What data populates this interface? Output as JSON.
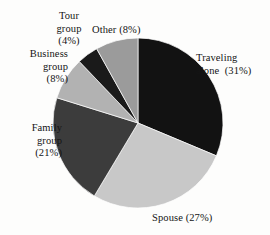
{
  "chart_data": {
    "type": "pie",
    "title": "",
    "subtitle": "",
    "xlabel": "",
    "ylabel": "",
    "legend_position": "none",
    "grid": false,
    "units": "percent",
    "start_angle_deg": 0,
    "direction": "clockwise",
    "categories": [
      "Traveling alone",
      "Spouse",
      "Family group",
      "Business group",
      "Tour group",
      "Other"
    ],
    "values": [
      31,
      27,
      21,
      8,
      4,
      8
    ],
    "slices": [
      {
        "name": "Traveling alone",
        "value": 31,
        "label": "Traveling\nalone  (31%)",
        "label_line1": "Traveling",
        "label_line2": "alone  (31%)",
        "percent_text": "(31%)",
        "color": "#121212"
      },
      {
        "name": "Spouse",
        "value": 27,
        "label": "Spouse (27%)",
        "label_line1": "Spouse (27%)",
        "label_line2": "",
        "percent_text": "(27%)",
        "color": "#c8c8c8"
      },
      {
        "name": "Family group",
        "value": 21,
        "label": "Family\ngroup\n(21%)",
        "label_line1": "Family",
        "label_line2": "group",
        "label_line3": "(21%)",
        "percent_text": "(21%)",
        "color": "#3c3c3c"
      },
      {
        "name": "Business group",
        "value": 8,
        "label": "Business\ngroup\n(8%)",
        "label_line1": "Business",
        "label_line2": "group",
        "label_line3": "(8%)",
        "percent_text": "(8%)",
        "color": "#b2b2b2"
      },
      {
        "name": "Tour group",
        "value": 4,
        "label": "Tour\ngroup\n(4%)",
        "label_line1": "Tour",
        "label_line2": "group",
        "label_line3": "(4%)",
        "percent_text": "(4%)",
        "color": "#1a1a1a"
      },
      {
        "name": "Other",
        "value": 8,
        "label": "Other (8%)",
        "label_line1": "Other (8%)",
        "label_line2": "",
        "percent_text": "(8%)",
        "color": "#9b9b9b"
      }
    ],
    "geometry": {
      "center_x": 138,
      "center_y": 123,
      "radius": 85
    },
    "background_color": "#fdfdfc"
  }
}
